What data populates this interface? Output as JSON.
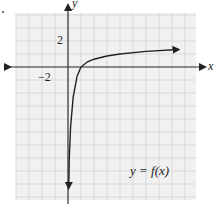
{
  "chart_data": {
    "type": "line",
    "title": "",
    "xlabel": "x",
    "ylabel": "y",
    "tick_labels": {
      "x": [
        "-2"
      ],
      "y": [
        "2"
      ]
    },
    "grid": true,
    "xlim": [
      -4,
      10
    ],
    "ylim": [
      -10,
      4
    ],
    "series": [
      {
        "name": "y = f(x)",
        "description": "logarithmic-shaped curve with vertical asymptote at x=0, crossing x-axis near x=1, increasing slowly to the right",
        "x": [
          0.05,
          0.1,
          0.2,
          0.4,
          0.7,
          1,
          1.5,
          2,
          3,
          4,
          6,
          8.5
        ],
        "y": [
          -9.3,
          -7.0,
          -4.6,
          -2.3,
          -0.7,
          0,
          0.4,
          0.6,
          0.85,
          1.0,
          1.2,
          1.35
        ]
      }
    ],
    "annotations": [
      "y = f(x)"
    ],
    "legend_position": "none"
  },
  "labels": {
    "x_axis": "x",
    "y_axis": "y",
    "x_tick": "−2",
    "y_tick": "2",
    "function": "y = f(x)"
  },
  "colors": {
    "grid": "#d4d4d4",
    "grid_bg": "#f1f1f1",
    "axis": "#333333",
    "curve": "#222222"
  }
}
